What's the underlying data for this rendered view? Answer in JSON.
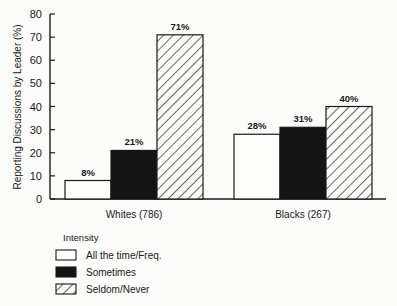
{
  "chart_data": {
    "type": "bar",
    "title": "",
    "xlabel": "",
    "ylabel": "Reporting Discussions by Leader (%)",
    "ylim": [
      0,
      80
    ],
    "yticks": [
      0,
      10,
      20,
      30,
      40,
      50,
      60,
      70,
      80
    ],
    "grid": false,
    "categories": [
      "Whites (786)",
      "Blacks (267)"
    ],
    "series": [
      {
        "name": "All the time/Freq.",
        "values": [
          8,
          28
        ],
        "labels": [
          "8%",
          "28%"
        ],
        "fill": "white"
      },
      {
        "name": "Sometimes",
        "values": [
          21,
          31
        ],
        "labels": [
          "21%",
          "31%"
        ],
        "fill": "black"
      },
      {
        "name": "Seldom/Never",
        "values": [
          71,
          40
        ],
        "labels": [
          "71%",
          "40%"
        ],
        "fill": "hatched"
      }
    ],
    "legend": {
      "title": "Intensity",
      "position": "bottom-left",
      "entries": [
        "All the time/Freq.",
        "Sometimes",
        "Seldom/Never"
      ]
    }
  },
  "colors": {
    "ink": "#1a1a1a",
    "background": "#fbfbf9"
  }
}
